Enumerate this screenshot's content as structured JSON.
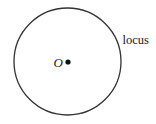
{
  "diagram": {
    "type": "geometric-locus",
    "circle": {
      "cx": 67.5,
      "cy": 61.5,
      "r": 53.5,
      "stroke": "#333333",
      "stroke_width": 1.3
    },
    "center_point": {
      "cx": 68,
      "cy": 62,
      "r": 2.6,
      "fill": "#111111"
    },
    "labels": {
      "center": "O",
      "locus": "locus"
    }
  }
}
